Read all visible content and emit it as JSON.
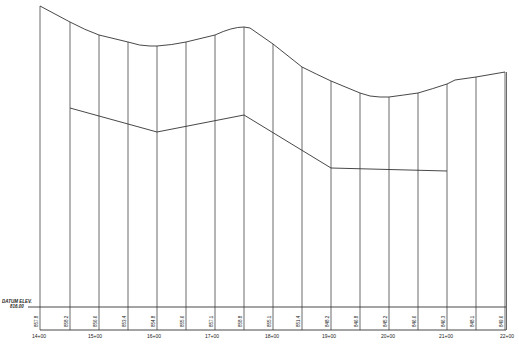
{
  "drawing": {
    "datum_label_line1": "DATUM ELEV.",
    "datum_label_line2": "816.00",
    "stations": [
      {
        "x": 39,
        "label": "14+00"
      },
      {
        "x": 95,
        "label": "15+00"
      },
      {
        "x": 154,
        "label": "16+00"
      },
      {
        "x": 212,
        "label": "17+00"
      },
      {
        "x": 272,
        "label": "18+00"
      },
      {
        "x": 329,
        "label": "19+00"
      },
      {
        "x": 388,
        "label": "20+00"
      },
      {
        "x": 446,
        "label": "21+00"
      },
      {
        "x": 507,
        "label": "22+00"
      }
    ],
    "elevation_labels": [
      {
        "x": 40,
        "value": "857.8"
      },
      {
        "x": 70,
        "value": "858.2"
      },
      {
        "x": 99,
        "value": "856.6"
      },
      {
        "x": 128,
        "value": "853.4"
      },
      {
        "x": 157,
        "value": "854.8"
      },
      {
        "x": 186,
        "value": "855.6"
      },
      {
        "x": 215,
        "value": "857.1"
      },
      {
        "x": 244,
        "value": "858.8"
      },
      {
        "x": 273,
        "value": "855.1"
      },
      {
        "x": 302,
        "value": "851.4"
      },
      {
        "x": 331,
        "value": "848.2"
      },
      {
        "x": 360,
        "value": "846.8"
      },
      {
        "x": 389,
        "value": "845.2"
      },
      {
        "x": 418,
        "value": "846.6"
      },
      {
        "x": 447,
        "value": "846.3"
      },
      {
        "x": 476,
        "value": "848.1"
      },
      {
        "x": 505,
        "value": "849.6"
      }
    ],
    "colors": {
      "line": "#333333",
      "background": "#ffffff"
    }
  }
}
